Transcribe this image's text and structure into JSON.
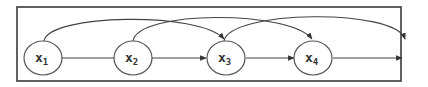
{
  "diagram": {
    "type": "sequence-skip-connections",
    "colors": {
      "frame": "#3a3a3a",
      "node_stroke": "#555555",
      "edge": "#444444",
      "text": "#333333",
      "background": "#ffffff"
    },
    "nodes": [
      {
        "id": "x1",
        "base": "x",
        "sub": "1"
      },
      {
        "id": "x2",
        "base": "x",
        "sub": "2"
      },
      {
        "id": "x3",
        "base": "x",
        "sub": "3"
      },
      {
        "id": "x4",
        "base": "x",
        "sub": "4"
      }
    ],
    "edges": [
      {
        "from": "x1",
        "to": "x2",
        "kind": "straight"
      },
      {
        "from": "x2",
        "to": "x3",
        "kind": "straight"
      },
      {
        "from": "x3",
        "to": "x4",
        "kind": "straight"
      },
      {
        "from": "x4",
        "to": "output",
        "kind": "straight"
      },
      {
        "from": "x1",
        "to": "x3",
        "kind": "arc"
      },
      {
        "from": "x2",
        "to": "x4",
        "kind": "arc"
      },
      {
        "from": "x3",
        "to": "output",
        "kind": "arc"
      }
    ]
  }
}
